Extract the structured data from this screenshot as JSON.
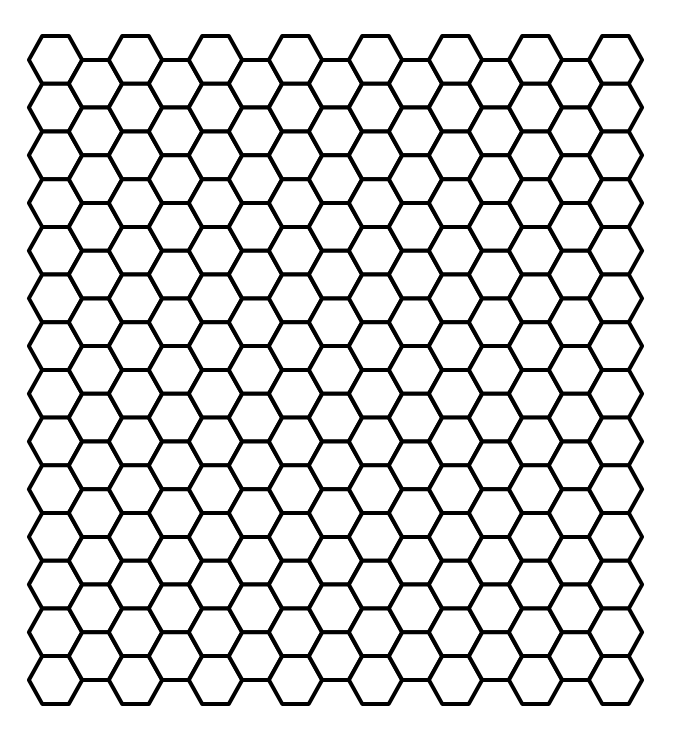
{
  "canvas": {
    "width": 679,
    "height": 730,
    "background": "#ffffff"
  },
  "pattern": {
    "type": "hexagonal-grid",
    "orientation": "flat-top",
    "stroke_color": "#000000",
    "fill_color": "#ffffff",
    "stroke_width": 4,
    "columns": 15,
    "rows_even_columns": 14,
    "rows_odd_columns": 13,
    "hex_width": 53.3,
    "hex_height": 47.7,
    "column_spacing": 40,
    "origin_center_x": 55.5,
    "origin_center_y": 59.9
  }
}
